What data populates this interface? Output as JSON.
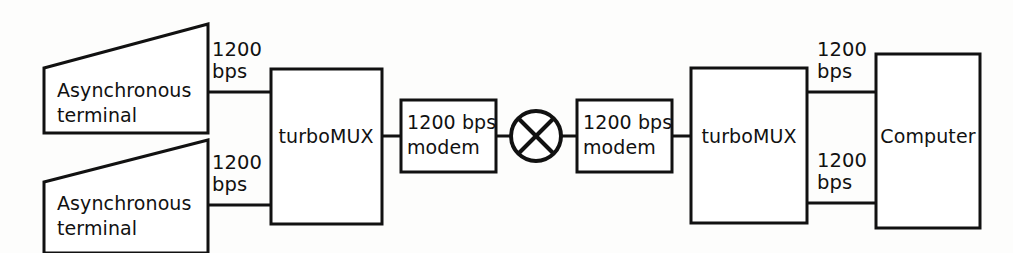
{
  "diagram": {
    "type": "network-block-diagram",
    "background_color": "#fdfdfc",
    "line_color": "#111111",
    "fill_color": "#ffffff",
    "nodes": [
      {
        "id": "terminal-top",
        "shape": "trapezoid",
        "label_line1": "Asynchronous",
        "label_line2": "terminal"
      },
      {
        "id": "terminal-bottom",
        "shape": "trapezoid",
        "label_line1": "Asynchronous",
        "label_line2": "terminal"
      },
      {
        "id": "mux-left",
        "shape": "rectangle",
        "label_line1": "turboMUX",
        "label_line2": ""
      },
      {
        "id": "modem-left",
        "shape": "rectangle",
        "label_line1": "1200 bps",
        "label_line2": "modem"
      },
      {
        "id": "network-symbol",
        "shape": "circle-with-x",
        "label_line1": "",
        "label_line2": ""
      },
      {
        "id": "modem-right",
        "shape": "rectangle",
        "label_line1": "1200 bps",
        "label_line2": "modem"
      },
      {
        "id": "mux-right",
        "shape": "rectangle",
        "label_line1": "turboMUX",
        "label_line2": ""
      },
      {
        "id": "computer",
        "shape": "rectangle",
        "label_line1": "Computer",
        "label_line2": ""
      }
    ],
    "rate_labels": [
      {
        "id": "rate-top-left",
        "line1": "1200",
        "line2": "bps"
      },
      {
        "id": "rate-bottom-left",
        "line1": "1200",
        "line2": "bps"
      },
      {
        "id": "rate-top-right",
        "line1": "1200",
        "line2": "bps"
      },
      {
        "id": "rate-bottom-right",
        "line1": "1200",
        "line2": "bps"
      }
    ]
  }
}
